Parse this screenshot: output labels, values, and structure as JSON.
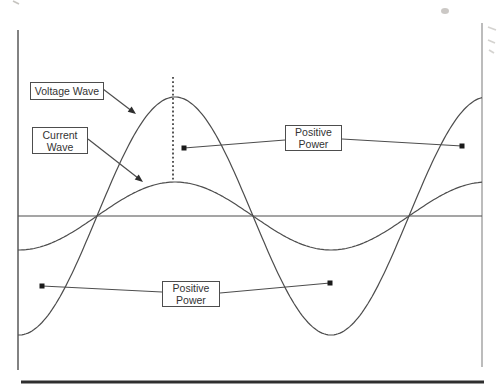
{
  "colors": {
    "background": "#ffffff",
    "ink": "#4d4d4d",
    "dark_ink": "#2e2e2e",
    "light_ink": "#8f8f8f",
    "marker": "#1a1a1a",
    "text": "#333333",
    "artifact": "#b9b6b1"
  },
  "labels": {
    "voltage_wave": "Voltage Wave",
    "current_wave": [
      "Current",
      "Wave"
    ],
    "positive_power_top": [
      "Positive",
      "Power"
    ],
    "positive_power_bottom": [
      "Positive",
      "Power"
    ]
  },
  "chart_data": {
    "type": "line",
    "title": "",
    "xlabel": "",
    "ylabel": "",
    "axes_numeric_labels": false,
    "series": [
      {
        "name": "Voltage Wave",
        "waveform": "sine",
        "relative_amplitude": 1.0,
        "phase_offset_deg": 0
      },
      {
        "name": "Current Wave",
        "waveform": "sine",
        "relative_amplitude": 0.29,
        "phase_offset_deg": 0
      }
    ],
    "annotations": [
      "Voltage Wave callout with arrow to voltage curve",
      "Current Wave callout with arrow to current curve",
      "Positive Power callout linking two markers in positive half-cycle",
      "Positive Power callout linking two markers in negative half-cycle",
      "Dashed vertical line through aligned wave peaks"
    ],
    "geometry": {
      "width": 499,
      "height": 390,
      "left_axis": {
        "x": 18,
        "y1": 30,
        "y2": 370
      },
      "right_axis": {
        "x": 482,
        "y1": 23,
        "y2": 367
      },
      "zero_line": {
        "y": 216,
        "x1": 18,
        "x2": 482
      },
      "bottom_rule": {
        "y": 382,
        "x1": 21,
        "x2": 484,
        "width": 3
      },
      "waves": {
        "x_start": 18,
        "x_end": 482,
        "period_px": 312,
        "rising_zero_x": 97,
        "voltage_amplitude_px": 119,
        "current_amplitude_px": 34
      },
      "peak_marker_line": {
        "x": 173,
        "y1": 77,
        "y2": 181
      },
      "arrows": [
        {
          "x1": 103,
          "y1": 89,
          "x2": 136,
          "y2": 114
        },
        {
          "x1": 88,
          "y1": 139,
          "x2": 143,
          "y2": 182
        }
      ],
      "connectors": [
        {
          "x1": 184,
          "y1": 148,
          "x2": 285,
          "y2": 140
        },
        {
          "x1": 342,
          "y1": 139,
          "x2": 462,
          "y2": 146
        },
        {
          "x1": 42,
          "y1": 286,
          "x2": 162,
          "y2": 292
        },
        {
          "x1": 220,
          "y1": 293,
          "x2": 330,
          "y2": 283
        }
      ],
      "markers": [
        {
          "x": 184,
          "y": 148
        },
        {
          "x": 462,
          "y": 146
        },
        {
          "x": 42,
          "y": 286
        },
        {
          "x": 330,
          "y": 283
        }
      ],
      "artifacts": {
        "blob": {
          "x": 445,
          "y": 11,
          "rx": 4,
          "ry": 3
        },
        "scribbles": [
          [
            488,
            27,
            496,
            30
          ],
          [
            488,
            40,
            495,
            43
          ],
          [
            489,
            50,
            494,
            53
          ]
        ],
        "top_left_mark": [
          13,
          1,
          19,
          4
        ]
      }
    }
  }
}
